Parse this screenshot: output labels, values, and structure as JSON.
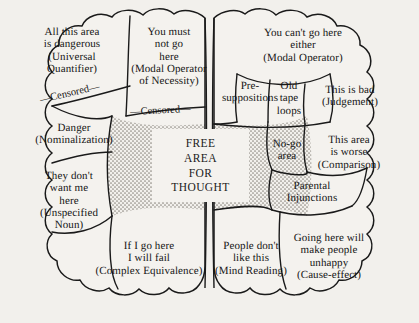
{
  "figure": {
    "background_color": "#f2f0ec",
    "ink_color": "#151515",
    "stipple_color": "#9a968e"
  },
  "center": {
    "name": "free-area-for-thought",
    "text": "FREE\nAREA\nFOR\nTHOUGHT"
  },
  "connector_labels": [
    {
      "name": "censored-upper-left",
      "text": "—Censored—"
    },
    {
      "name": "censored-lower-middle",
      "text": "—Censored—"
    }
  ],
  "left_hemisphere": {
    "name": "left-hemisphere",
    "cells": [
      {
        "id": "universal-quantifier",
        "text": "All this area\nis dangerous\n(Universal\nQuantifier)"
      },
      {
        "id": "modal-operator-necessity",
        "text": "You must\nnot go\nhere\n(Modal Operator\nof Necessity)"
      },
      {
        "id": "nominalization",
        "text": "Danger\n(Nominalization)"
      },
      {
        "id": "unspecified-noun",
        "text": "They don't\nwant me\nhere\n(Unspecified\nNoun)"
      },
      {
        "id": "complex-equivalence",
        "text": "If I go here\nI will fail\n(Complex Equivalence)"
      }
    ]
  },
  "right_hemisphere": {
    "name": "right-hemisphere",
    "cells": [
      {
        "id": "modal-operator",
        "text": "You can't go here\neither\n(Modal Operator)"
      },
      {
        "id": "presuppositions",
        "text": "Pre-\nsuppositions"
      },
      {
        "id": "old-tape-loops",
        "text": "Old\ntape\nloops"
      },
      {
        "id": "judgement",
        "text": "This is bad\n(Judgement)"
      },
      {
        "id": "no-go-area",
        "text": "No-go\narea"
      },
      {
        "id": "comparison",
        "text": "This area\nis worse\n(Comparison)"
      },
      {
        "id": "parental-injunctions",
        "text": "Parental\nInjunctions"
      },
      {
        "id": "mind-reading",
        "text": "People don't\nlike this\n(Mind Reading)"
      },
      {
        "id": "cause-effect",
        "text": "Going here will\nmake people\nunhappy\n(Cause-effect)"
      }
    ]
  }
}
